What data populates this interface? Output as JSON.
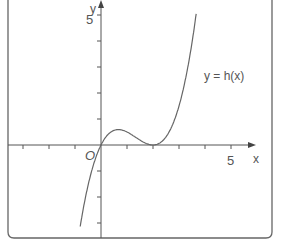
{
  "chart_data": {
    "type": "line",
    "title": "",
    "xlabel": "x",
    "ylabel": "y",
    "origin_label": "O",
    "curve_label": "y = h(x)",
    "function": "h(x) = 0.5·x·(x−2)^2 (approximate shape)",
    "x_ticks": [
      -3,
      -2,
      -1,
      1,
      2,
      3,
      4,
      5
    ],
    "y_ticks": [
      -3,
      -2,
      -1,
      1,
      2,
      3,
      4,
      5
    ],
    "x_tick_labels": {
      "5": "5"
    },
    "y_tick_labels": {
      "5": "5"
    },
    "xlim": [
      -3.6,
      5.9
    ],
    "ylim": [
      -3.4,
      5.5
    ],
    "series": [
      {
        "name": "h(x)",
        "points": [
          {
            "x": -0.75,
            "y": -2.8
          },
          {
            "x": -0.5,
            "y": -1.56
          },
          {
            "x": 0,
            "y": 0
          },
          {
            "x": 0.67,
            "y": 0.59
          },
          {
            "x": 1,
            "y": 0.5
          },
          {
            "x": 1.5,
            "y": 0.19
          },
          {
            "x": 2,
            "y": 0
          },
          {
            "x": 2.5,
            "y": 0.31
          },
          {
            "x": 3,
            "y": 1.5
          },
          {
            "x": 3.5,
            "y": 3.94
          },
          {
            "x": 3.7,
            "y": 5.35
          }
        ]
      }
    ],
    "features": {
      "root_at_origin": 0,
      "double_root_tangent": 2,
      "local_max_near_x": 0.67
    },
    "grid": false,
    "legend": "none"
  },
  "colors": {
    "axis": "#555555",
    "curve": "#666666",
    "frame": "#555555"
  }
}
